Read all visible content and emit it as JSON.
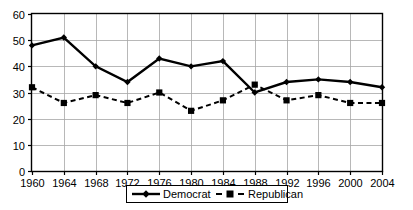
{
  "chart_data": {
    "type": "line",
    "title": "",
    "subtitle": "",
    "xlabel": "",
    "ylabel": "",
    "categories": [
      1960,
      1964,
      1968,
      1972,
      1976,
      1980,
      1984,
      1988,
      1992,
      1996,
      2000,
      2004
    ],
    "x_tick_labels": [
      "1960",
      "1964",
      "1968",
      "1972",
      "1976",
      "1980",
      "1984",
      "1988",
      "1992",
      "1996",
      "2000",
      "2004"
    ],
    "y_tick_labels": [
      "0",
      "10",
      "20",
      "30",
      "40",
      "50",
      "60"
    ],
    "y_ticks": [
      0,
      10,
      20,
      30,
      40,
      50,
      60
    ],
    "ylim": [
      0,
      60
    ],
    "xlim": [
      1960,
      2004
    ],
    "grid": true,
    "grid_axis": "both",
    "legend_position": "bottom-center",
    "series": [
      {
        "name": "Democrat",
        "marker": "diamond",
        "line_style": "solid",
        "color": "#000000",
        "values": [
          48,
          51,
          40,
          34,
          43,
          40,
          42,
          30,
          34,
          35,
          34,
          32
        ]
      },
      {
        "name": "Republican",
        "marker": "square",
        "line_style": "dashed",
        "color": "#000000",
        "values": [
          32,
          26,
          29,
          26,
          30,
          23,
          27,
          33,
          27,
          29,
          26,
          26
        ]
      }
    ]
  },
  "legend": {
    "entries": [
      {
        "label": "Democrat"
      },
      {
        "label": "Republican"
      }
    ]
  },
  "colors": {
    "background": "#ffffff",
    "gridline": "#a6a6a6",
    "axis": "#000000",
    "series": "#000000"
  }
}
